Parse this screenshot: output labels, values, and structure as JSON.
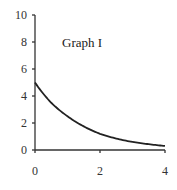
{
  "chart_data": {
    "type": "line",
    "title": "Graph I",
    "xlabel": "",
    "ylabel": "",
    "xlim": [
      0,
      4
    ],
    "ylim": [
      0,
      10
    ],
    "x_ticks": [
      "0",
      "2",
      "4"
    ],
    "y_ticks": [
      "0",
      "2",
      "4",
      "6",
      "8",
      "10"
    ],
    "grid": false,
    "legend": null,
    "series": [
      {
        "name": "Graph I",
        "x": [
          0,
          0.5,
          1,
          1.5,
          2,
          2.5,
          3,
          3.5,
          4
        ],
        "values": [
          5.0,
          3.5,
          2.5,
          1.75,
          1.2,
          0.85,
          0.6,
          0.43,
          0.3
        ]
      }
    ],
    "color": "#222222"
  }
}
